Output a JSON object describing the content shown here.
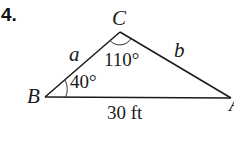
{
  "problem": {
    "number": "4."
  },
  "triangle": {
    "vertices": {
      "A": "A",
      "B": "B",
      "C": "C"
    },
    "sides": {
      "a": "a",
      "b": "b",
      "c": "30 ft"
    },
    "angles": {
      "B": "40°",
      "C": "110°"
    },
    "colors": {
      "stroke": "#1a1a1a",
      "background": "#ffffff"
    }
  }
}
